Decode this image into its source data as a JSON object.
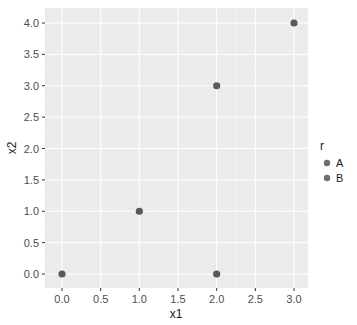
{
  "chart_data": {
    "type": "scatter",
    "title": "",
    "xlabel": "x1",
    "ylabel": "x2",
    "xlim": [
      -0.15,
      3.15
    ],
    "ylim": [
      -0.2,
      4.2
    ],
    "x_ticks": [
      0.0,
      0.5,
      1.0,
      1.5,
      2.0,
      2.5,
      3.0
    ],
    "x_tick_labels": [
      "0.0",
      "0.5",
      "1.0",
      "1.5",
      "2.0",
      "2.5",
      "3.0"
    ],
    "y_ticks": [
      0.0,
      0.5,
      1.0,
      1.5,
      2.0,
      2.5,
      3.0,
      3.5,
      4.0
    ],
    "y_tick_labels": [
      "0.0",
      "0.5",
      "1.0",
      "1.5",
      "2.0",
      "2.5",
      "3.0",
      "3.5",
      "4.0"
    ],
    "grid": true,
    "legend_position": "right",
    "legend_title": "r",
    "legend_entries": [
      "A",
      "B"
    ],
    "points": [
      {
        "x": 0,
        "y": 0
      },
      {
        "x": 1,
        "y": 1
      },
      {
        "x": 2,
        "y": 3
      },
      {
        "x": 3,
        "y": 4
      },
      {
        "x": 2,
        "y": 0
      }
    ],
    "colors": {
      "panel_bg": "#ebebeb",
      "grid_major": "#ffffff",
      "grid_minor": "#f5f5f5",
      "point": "#595959",
      "legend_point": "#6e6e6e"
    }
  }
}
